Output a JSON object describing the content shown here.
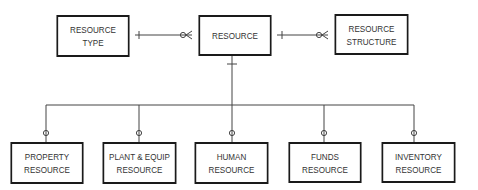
{
  "diagram": {
    "type": "entity-relationship",
    "entities": {
      "resource_type": {
        "line1": "RESOURCE",
        "line2": "TYPE"
      },
      "resource": {
        "line1": "RESOURCE"
      },
      "resource_structure": {
        "line1": "RESOURCE",
        "line2": "STRUCTURE"
      },
      "property_resource": {
        "line1": "PROPERTY",
        "line2": "RESOURCE"
      },
      "plant_equip_resource": {
        "line1": "PLANT & EQUIP",
        "line2": "RESOURCE"
      },
      "human_resource": {
        "line1": "HUMAN",
        "line2": "RESOURCE"
      },
      "funds_resource": {
        "line1": "FUNDS",
        "line2": "RESOURCE"
      },
      "inventory_resource": {
        "line1": "INVENTORY",
        "line2": "RESOURCE"
      }
    },
    "relationships": [
      {
        "from": "RESOURCE TYPE",
        "to": "RESOURCE",
        "from_card": "one",
        "to_card": "zero-or-many"
      },
      {
        "from": "RESOURCE",
        "to": "RESOURCE STRUCTURE",
        "from_card": "one",
        "to_card": "zero-or-many"
      },
      {
        "from": "RESOURCE",
        "to": "subtypes",
        "from_card": "one",
        "to_card": "zero-or-one"
      }
    ],
    "colors": {
      "line": "#333333",
      "border": "#1a1a1a",
      "text": "#333333"
    }
  }
}
